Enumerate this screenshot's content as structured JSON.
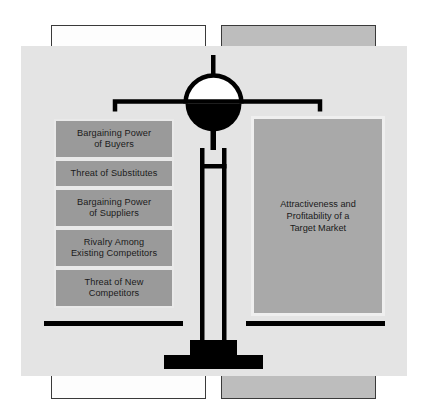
{
  "diagram": {
    "left_pan": {
      "label": "Five Forces",
      "boxes": [
        {
          "text": "Bargaining Power of Buyers",
          "lines": [
            "Bargaining Power",
            "of Buyers"
          ]
        },
        {
          "text": "Threat of Substitutes",
          "lines": [
            "Threat of Substitutes"
          ]
        },
        {
          "text": "Bargaining Power of Suppliers",
          "lines": [
            "Bargaining Power",
            "of Suppliers"
          ]
        },
        {
          "text": "Rivalry Among Existing Competitors",
          "lines": [
            "Rivalry Among",
            "Existing Competitors"
          ]
        },
        {
          "text": "Threat of New Competitors",
          "lines": [
            "Threat of New",
            "Competitors"
          ]
        }
      ]
    },
    "right_pan": {
      "text": "Attractiveness and Profitability of a Target Market",
      "lines": [
        "Attractiveness and",
        "Profitability of a",
        "Target Market"
      ]
    },
    "colors": {
      "page_background": "#ffffff",
      "main_panel": "#e4e4e4",
      "force_box_fill": "#9a9a9a",
      "force_box_border": "#e9e9e9",
      "outcome_fill": "#a9a9a9",
      "outcome_border": "#efefef",
      "scale_ink": "#000000",
      "frame_white": "#fdfdfd",
      "frame_gray": "#bdbdbd",
      "frame_border": "#3a3a3a",
      "text": "#1a1a1a"
    },
    "icons": {
      "balance": "balance-scale-icon",
      "fulcrum": "fulcrum-circle-icon",
      "pedestal": "pedestal-base-icon"
    }
  }
}
